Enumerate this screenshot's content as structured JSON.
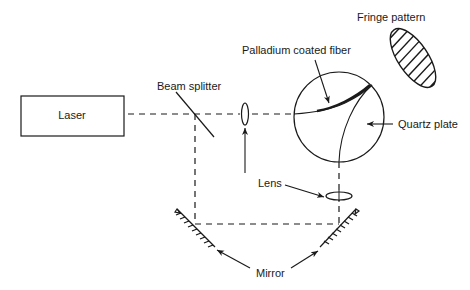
{
  "diagram": {
    "labels": {
      "laser": "Laser",
      "beam_splitter": "Beam splitter",
      "palladium_fiber": "Palladium coated fiber",
      "fringe_pattern": "Fringe pattern",
      "quartz_plate": "Quartz plate",
      "lens": "Lens",
      "mirror": "Mirror"
    },
    "colors": {
      "stroke": "#1a1a1a",
      "background": "#ffffff"
    }
  }
}
